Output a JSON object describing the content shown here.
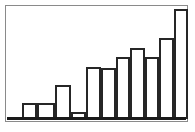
{
  "figure": {
    "name": "bar-chart-figure",
    "background_color": "#ffffff",
    "frame_color": "#8a8a8a",
    "axis_color": "#1a1a1a",
    "bar_outline_color": "#262626",
    "bar_fill_color": "#ffffff"
  },
  "chart_data": {
    "type": "bar",
    "title": "",
    "subtitle": "",
    "xlabel": "",
    "ylabel": "",
    "grid": false,
    "legend": null,
    "legend_position": "none",
    "annotations": [],
    "xlim": [
      0,
      11
    ],
    "ylim": [
      0,
      115
    ],
    "categories": [
      "1",
      "2",
      "3",
      "4",
      "5",
      "6",
      "7",
      "8",
      "9",
      "10",
      "11"
    ],
    "xtick_labels": [],
    "ytick_labels": [],
    "values": [
      16,
      16,
      34,
      7,
      52,
      51,
      62,
      71,
      62,
      81,
      110
    ],
    "bar_geometry": [
      {
        "index": 0,
        "left": 22,
        "width": 15,
        "top": 103,
        "height": 16
      },
      {
        "index": 1,
        "left": 37,
        "width": 18,
        "top": 103,
        "height": 16
      },
      {
        "index": 2,
        "left": 55,
        "width": 16,
        "top": 85,
        "height": 34
      },
      {
        "index": 3,
        "left": 71,
        "width": 15,
        "top": 112,
        "height": 7
      },
      {
        "index": 4,
        "left": 86,
        "width": 15,
        "top": 67,
        "height": 52
      },
      {
        "index": 5,
        "left": 101,
        "width": 15,
        "top": 68,
        "height": 51
      },
      {
        "index": 6,
        "left": 116,
        "width": 14,
        "top": 57,
        "height": 62
      },
      {
        "index": 7,
        "left": 130,
        "width": 15,
        "top": 48,
        "height": 71
      },
      {
        "index": 8,
        "left": 145,
        "width": 14,
        "top": 57,
        "height": 62
      },
      {
        "index": 9,
        "left": 159,
        "width": 15,
        "top": 38,
        "height": 81
      },
      {
        "index": 10,
        "left": 174,
        "width": 14,
        "top": 9,
        "height": 110
      }
    ]
  }
}
